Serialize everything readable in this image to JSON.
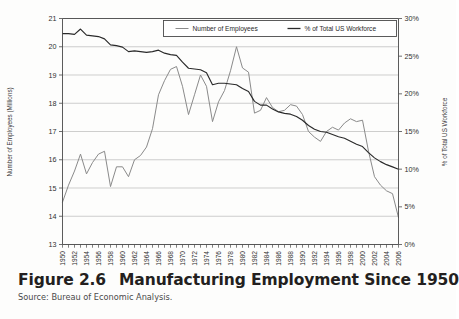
{
  "figure": {
    "number_label": "Figure 2.6",
    "title": "Manufacturing Employment Since 1950",
    "source": "Source: Bureau of Economic Analysis."
  },
  "chart_data": {
    "type": "line",
    "title": "Manufacturing Employment Since 1950",
    "xlabel": "",
    "ylabel": "Number of Employees (Millions)",
    "y2label": "% of Total US Workforce",
    "ylim": [
      13,
      21
    ],
    "y2lim": [
      0,
      30
    ],
    "yticks": [
      "13",
      "14",
      "15",
      "16",
      "17",
      "18",
      "19",
      "20",
      "21"
    ],
    "y2ticks": [
      "0%",
      "5%",
      "10%",
      "15%",
      "20%",
      "25%",
      "30%"
    ],
    "grid": true,
    "legend_position": "top-center",
    "x": [
      1950,
      1951,
      1952,
      1953,
      1954,
      1955,
      1956,
      1957,
      1958,
      1959,
      1960,
      1961,
      1962,
      1963,
      1964,
      1965,
      1966,
      1967,
      1968,
      1969,
      1970,
      1971,
      1972,
      1973,
      1974,
      1975,
      1976,
      1977,
      1978,
      1979,
      1980,
      1981,
      1982,
      1983,
      1984,
      1985,
      1986,
      1987,
      1988,
      1989,
      1990,
      1991,
      1992,
      1993,
      1994,
      1995,
      1996,
      1997,
      1998,
      1999,
      2000,
      2001,
      2002,
      2003,
      2004,
      2005,
      2006
    ],
    "xticks": [
      "1950",
      "1952",
      "1954",
      "1956",
      "1958",
      "1960",
      "1962",
      "1964",
      "1966",
      "1968",
      "1970",
      "1972",
      "1974",
      "1976",
      "1978",
      "1980",
      "1982",
      "1984",
      "1986",
      "1988",
      "1990",
      "1992",
      "1994",
      "1996",
      "1998",
      "2000",
      "2002",
      "2004",
      "2006"
    ],
    "series": [
      {
        "name": "Number of Employees",
        "axis": "left",
        "units": "millions",
        "color": "#8a8a8a",
        "values": [
          14.5,
          15.1,
          15.6,
          16.2,
          15.5,
          15.9,
          16.2,
          16.3,
          15.05,
          15.75,
          15.75,
          15.4,
          16.0,
          16.15,
          16.45,
          17.1,
          18.3,
          18.8,
          19.2,
          19.3,
          18.6,
          17.6,
          18.3,
          19.0,
          18.6,
          17.35,
          18.05,
          18.45,
          19.15,
          20.0,
          19.25,
          19.1,
          17.65,
          17.75,
          18.2,
          17.85,
          17.7,
          17.75,
          17.95,
          17.9,
          17.6,
          17.0,
          16.8,
          16.65,
          17.0,
          17.15,
          17.05,
          17.3,
          17.45,
          17.35,
          17.4,
          16.3,
          15.4,
          15.1,
          14.9,
          14.8,
          13.95
        ]
      },
      {
        "name": "% of Total US Workforce",
        "axis": "right",
        "units": "percent",
        "color": "#2a2a2a",
        "values": [
          28.0,
          28.0,
          27.9,
          28.6,
          27.8,
          27.7,
          27.6,
          27.3,
          26.5,
          26.4,
          26.2,
          25.6,
          25.7,
          25.6,
          25.5,
          25.6,
          25.8,
          25.4,
          25.2,
          25.1,
          24.2,
          23.4,
          23.3,
          23.2,
          22.8,
          21.2,
          21.4,
          21.4,
          21.3,
          21.2,
          20.7,
          20.3,
          19.0,
          18.5,
          18.5,
          18.0,
          17.6,
          17.4,
          17.3,
          17.0,
          16.5,
          15.8,
          15.3,
          15.0,
          14.9,
          14.6,
          14.3,
          14.1,
          13.7,
          13.3,
          13.0,
          12.2,
          11.5,
          11.0,
          10.6,
          10.3,
          10.0
        ]
      }
    ],
    "legend": [
      {
        "label": "Number of Employees",
        "color": "#8a8a8a"
      },
      {
        "label": "% of Total US Workforce",
        "color": "#2a2a2a"
      }
    ]
  }
}
